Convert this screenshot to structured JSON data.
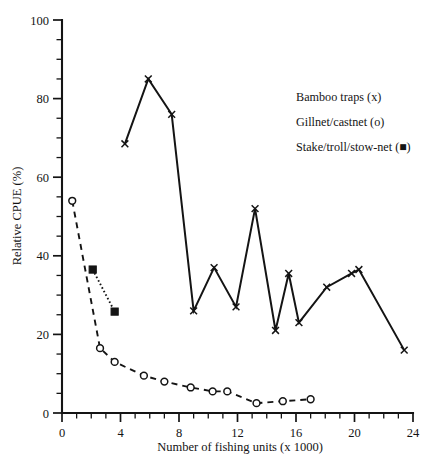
{
  "chart_data": {
    "type": "line",
    "title": "",
    "xlabel": "Number of fishing units (x 1000)",
    "ylabel": "Relative CPUE (%)",
    "xlim": [
      0,
      24
    ],
    "ylim": [
      0,
      100
    ],
    "xticks": [
      0,
      4,
      8,
      12,
      16,
      20,
      24
    ],
    "yticks": [
      0,
      20,
      40,
      60,
      80,
      100
    ],
    "x_minor_step": 1,
    "y_minor_step": 5,
    "grid": false,
    "legend_position": "upper-right",
    "series": [
      {
        "name": "Bamboo traps (x)",
        "marker": "cross",
        "linestyle": "solid",
        "points": [
          [
            4.3,
            68.5
          ],
          [
            5.9,
            85.0
          ],
          [
            7.5,
            76.0
          ],
          [
            9.0,
            26.0
          ],
          [
            10.4,
            37.0
          ],
          [
            11.9,
            27.0
          ],
          [
            13.2,
            52.0
          ],
          [
            14.6,
            21.0
          ],
          [
            15.5,
            35.5
          ],
          [
            16.2,
            23.0
          ],
          [
            18.1,
            32.0
          ],
          [
            19.8,
            35.5
          ],
          [
            20.3,
            36.5
          ],
          [
            23.4,
            16.0
          ]
        ]
      },
      {
        "name": "Gillnet/castnet (o)",
        "marker": "circle",
        "linestyle": "dashed",
        "points": [
          [
            0.7,
            54.0
          ],
          [
            2.6,
            16.5
          ],
          [
            3.6,
            13.0
          ],
          [
            5.6,
            9.5
          ],
          [
            7.0,
            8.0
          ],
          [
            8.8,
            6.5
          ],
          [
            10.3,
            5.5
          ],
          [
            11.3,
            5.5
          ],
          [
            13.3,
            2.5
          ],
          [
            15.1,
            3.0
          ],
          [
            17.0,
            3.5
          ]
        ]
      },
      {
        "name": "Stake/troll/stow-net (■)",
        "marker": "square",
        "linestyle": "dotted",
        "points": [
          [
            2.1,
            36.5
          ],
          [
            3.6,
            25.8
          ]
        ]
      }
    ]
  },
  "legend": {
    "entries": [
      {
        "label": "Bamboo traps (x)"
      },
      {
        "label": "Gillnet/castnet (o)"
      },
      {
        "label": "Stake/troll/stow-net (■)"
      }
    ]
  },
  "axes": {
    "x_title": "Number of fishing units (x 1000)",
    "y_title": "Relative CPUE (%)",
    "x_tick_labels": [
      "0",
      "4",
      "8",
      "12",
      "16",
      "20",
      "24"
    ],
    "y_tick_labels": [
      "0",
      "20",
      "40",
      "60",
      "80",
      "100"
    ]
  },
  "colors": {
    "ink": "#141414",
    "background": "#ffffff"
  }
}
